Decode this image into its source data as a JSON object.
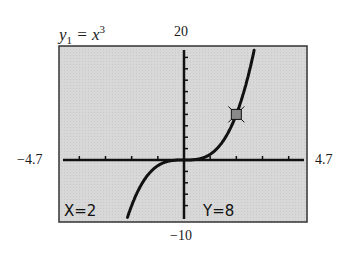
{
  "chart_data": {
    "type": "line",
    "function": "x^3",
    "series": [
      {
        "name": "y1",
        "x": [
          -2.6,
          -2,
          -1.5,
          -1,
          -0.5,
          0,
          0.5,
          1,
          1.5,
          2,
          2.5,
          2.85
        ],
        "values": [
          -17.576,
          -8,
          -3.375,
          -1,
          -0.125,
          0,
          0.125,
          1,
          3.375,
          8,
          15.625,
          23.149
        ]
      }
    ],
    "xlim": [
      -4.7,
      4.7
    ],
    "ylim": [
      -10,
      20
    ],
    "xtick_spacing": 1,
    "ytick_spacing": 2,
    "grid": false,
    "trace_point": {
      "x": 2,
      "y": 8
    },
    "window_labels": {
      "xmin": "−4.7",
      "xmax": "4.7",
      "ymax": "20",
      "ymin": "−10"
    }
  },
  "equation": {
    "lhs": "y",
    "sub": "1",
    "eq": " = x",
    "sup": "3"
  },
  "readout": {
    "x": "X=2",
    "y": "Y=8"
  },
  "colors": {
    "screen": "#d9d9d9",
    "ink": "#111111",
    "frame": "#333333",
    "marker": "#777777"
  }
}
